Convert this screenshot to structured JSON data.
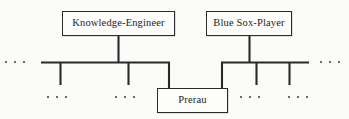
{
  "figure": {
    "kind": "taxonomy-fragment-diagram",
    "background_color": "#fbfbf9",
    "line_color": "#2a2a2a",
    "text_color": "#1c1c1c"
  },
  "nodes": [
    {
      "id": "knowledge-engineer",
      "label": "Knowledge-Engineer",
      "x": 62,
      "y": 11,
      "width": 113,
      "height": 25
    },
    {
      "id": "blue-sox-player",
      "label": "Blue Sox-Player",
      "x": 206,
      "y": 11,
      "width": 86,
      "height": 25
    },
    {
      "id": "prerau",
      "label": "Prerau",
      "x": 157,
      "y": 88,
      "width": 71,
      "height": 25
    }
  ],
  "ellipses": [
    {
      "id": "left-rail-continuation",
      "dots": 3
    },
    {
      "id": "right-rail-continuation",
      "dots": 3
    },
    {
      "id": "lower-left-continuation-a",
      "dots": 3
    },
    {
      "id": "lower-left-continuation-b",
      "dots": 3
    },
    {
      "id": "lower-right-continuation-a",
      "dots": 3
    },
    {
      "id": "lower-right-continuation-b",
      "dots": 3
    }
  ]
}
